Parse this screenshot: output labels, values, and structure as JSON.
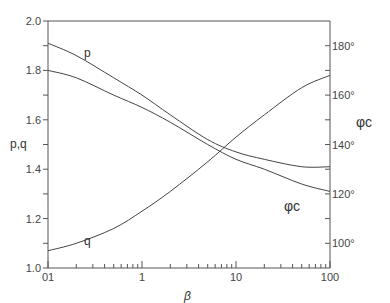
{
  "chart_data": {
    "type": "line",
    "title": "",
    "xlabel": "β",
    "ylabel": "p, q",
    "y2label": "φc",
    "xscale": "log",
    "xlim": [
      0.1,
      100
    ],
    "ylim": [
      1.0,
      2.0
    ],
    "y2lim": [
      90,
      190
    ],
    "x_tick_labels": [
      "01",
      "1",
      "10",
      "100"
    ],
    "y_tick_labels": [
      "1.0",
      "1.2",
      "1.4",
      "1.6",
      "1.8",
      "2.0"
    ],
    "y2_tick_labels": [
      "100°",
      "120°",
      "140°",
      "160°",
      "180°"
    ],
    "grid": false,
    "legend": "inline curve labels",
    "x": [
      0.1,
      0.2,
      0.5,
      1,
      2,
      5,
      10,
      20,
      50,
      100
    ],
    "series": [
      {
        "name": "p",
        "axis": "left",
        "label_pos": [
          0.2,
          1.84
        ],
        "values": [
          1.91,
          1.86,
          1.77,
          1.7,
          1.62,
          1.52,
          1.47,
          1.44,
          1.41,
          1.41
        ]
      },
      {
        "name": "q",
        "axis": "left",
        "label_pos": [
          0.22,
          1.12
        ],
        "values": [
          1.07,
          1.1,
          1.16,
          1.23,
          1.31,
          1.43,
          1.53,
          1.62,
          1.73,
          1.78
        ]
      },
      {
        "name": "φc",
        "axis": "right",
        "label_pos": [
          18,
          123
        ],
        "values": [
          170,
          167,
          160,
          155,
          149,
          140,
          134,
          130,
          124,
          121
        ]
      }
    ]
  },
  "labels": {
    "p_curve": "p",
    "q_curve": "q",
    "phi_curve": "φc",
    "x_axis": "β",
    "y_axis": "p,q",
    "y2_axis": "φc"
  }
}
